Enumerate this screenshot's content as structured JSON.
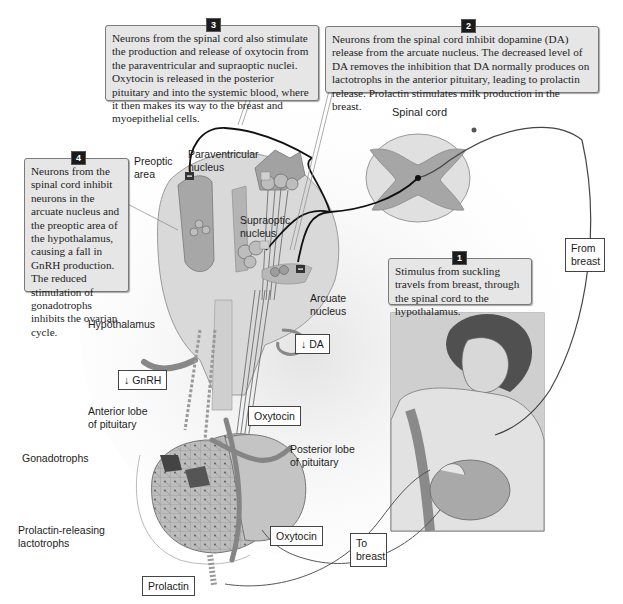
{
  "callouts": [
    {
      "number": "1",
      "text": "Stimulus from suckling travels from breast, through the spinal cord to the hypothalamus."
    },
    {
      "number": "2",
      "text": "Neurons from the spinal cord inhibit dopamine (DA) release from the arcuate nucleus. The decreased level of DA removes the inhibition that DA normally produces on lactotrophs in the anterior pituitary, leading to prolactin release. Prolactin stimulates milk production in the breast."
    },
    {
      "number": "3",
      "text": "Neurons from the spinal cord also stimulate the production and release of oxytocin from the paraventricular and supraoptic nuclei. Oxytocin is released in the posterior pituitary and into the systemic blood, where it then makes its way to the breast and myoepithelial cells."
    },
    {
      "number": "4",
      "text": "Neurons from the spinal cord inhibit neurons in the arcuate nucleus and the preoptic area of the hypothalamus, causing a fall in GnRH production. The reduced stimulation of gonadotrophs inhibits the ovarian cycle."
    }
  ],
  "labels": {
    "spinal_cord": "Spinal cord",
    "preoptic_area_1": "Preoptic",
    "preoptic_area_2": "area",
    "paraventricular_1": "Paraventricular",
    "paraventricular_2": "nucleus",
    "supraoptic_1": "Supraoptic",
    "supraoptic_2": "nucleus",
    "arcuate_1": "Arcuate",
    "arcuate_2": "nucleus",
    "hypothalamus": "Hypothalamus",
    "anterior_lobe_1": "Anterior lobe",
    "anterior_lobe_2": "of pituitary",
    "posterior_lobe_1": "Posterior lobe",
    "posterior_lobe_2": "of pituitary",
    "gonadotrophs": "Gonadotrophs",
    "lactotrophs_1": "Prolactin-releasing",
    "lactotrophs_2": "lactotrophs"
  },
  "boxed_labels": {
    "from_breast": "From breast",
    "to_breast": "To breast",
    "da": "↓ DA",
    "gnrh": "↓ GnRH",
    "oxytocin_top": "Oxytocin",
    "oxytocin_bottom": "Oxytocin",
    "prolactin": "Prolactin"
  },
  "signs": {
    "minus": "−",
    "plus": "+"
  },
  "colors": {
    "callout_bg": "#e6e6e6",
    "tissue_gray": "#a9a9a9",
    "tissue_light": "#d4d4d4",
    "vessel": "#7c7c7c"
  }
}
